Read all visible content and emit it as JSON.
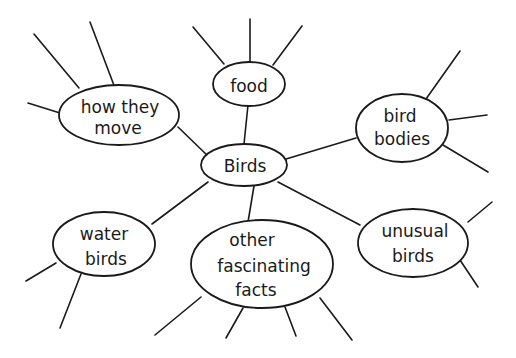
{
  "diagram": {
    "type": "mind-map",
    "style": "hand-drawn",
    "colors": {
      "stroke": "#1a1a1a",
      "background": "#ffffff"
    },
    "center": {
      "label": "Birds"
    },
    "nodes": [
      {
        "id": "how-they-move",
        "lines": [
          "how they",
          "move"
        ]
      },
      {
        "id": "food",
        "lines": [
          "food"
        ]
      },
      {
        "id": "bird-bodies",
        "lines": [
          "bird",
          "bodies"
        ]
      },
      {
        "id": "water-birds",
        "lines": [
          "water",
          "birds"
        ]
      },
      {
        "id": "other-fascinating-facts",
        "lines": [
          "other",
          "fascinating",
          "facts"
        ]
      },
      {
        "id": "unusual-birds",
        "lines": [
          "unusual",
          "birds"
        ]
      }
    ]
  }
}
